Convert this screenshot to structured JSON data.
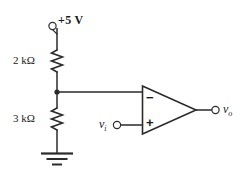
{
  "diagram": {
    "type": "schematic",
    "stroke_color": "#2b2b2b",
    "text_color": "#1a1a1a",
    "background": "#ffffff"
  },
  "supply": {
    "label": "+5 V",
    "terminal_name": "supply-terminal",
    "voltage_value": 5,
    "voltage_unit": "V"
  },
  "resistors": [
    {
      "id": "r-top",
      "label": "2 kΩ",
      "value": 2,
      "unit": "kΩ",
      "orientation": "vertical",
      "position": "top"
    },
    {
      "id": "r-bottom",
      "label": "3 kΩ",
      "value": 3,
      "unit": "kΩ",
      "orientation": "vertical",
      "position": "bottom"
    }
  ],
  "opamp": {
    "name": "operational-amplifier",
    "inverting_label": "−",
    "noninverting_label": "+",
    "inverting_input_source": "divider-node",
    "noninverting_input_source": "vi"
  },
  "signals": {
    "input": {
      "symbol": "v",
      "subscript": "i",
      "terminal_name": "vi-terminal"
    },
    "output": {
      "symbol": "v",
      "subscript": "o",
      "terminal_name": "vo-terminal"
    }
  },
  "ground": {
    "label": "",
    "name": "ground-symbol",
    "bars": 3
  },
  "nodes": {
    "divider_junction": "divider-node"
  }
}
